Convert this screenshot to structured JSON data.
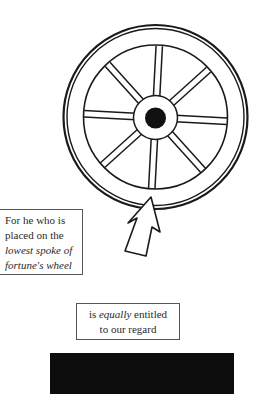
{
  "diagram": {
    "spoke_count": 8,
    "colors": {
      "ink": "#1a1a1a",
      "background": "#ffffff",
      "bar": "#0d0d0d"
    }
  },
  "caption_left": {
    "line1": "For he who is",
    "line2": "placed on the",
    "line3": "lowest spoke of",
    "line4": "fortune's wheel"
  },
  "caption_center": {
    "line1_pre": "is ",
    "line1_em": "equally",
    "line1_post": " entitled",
    "line2": "to our regard"
  }
}
